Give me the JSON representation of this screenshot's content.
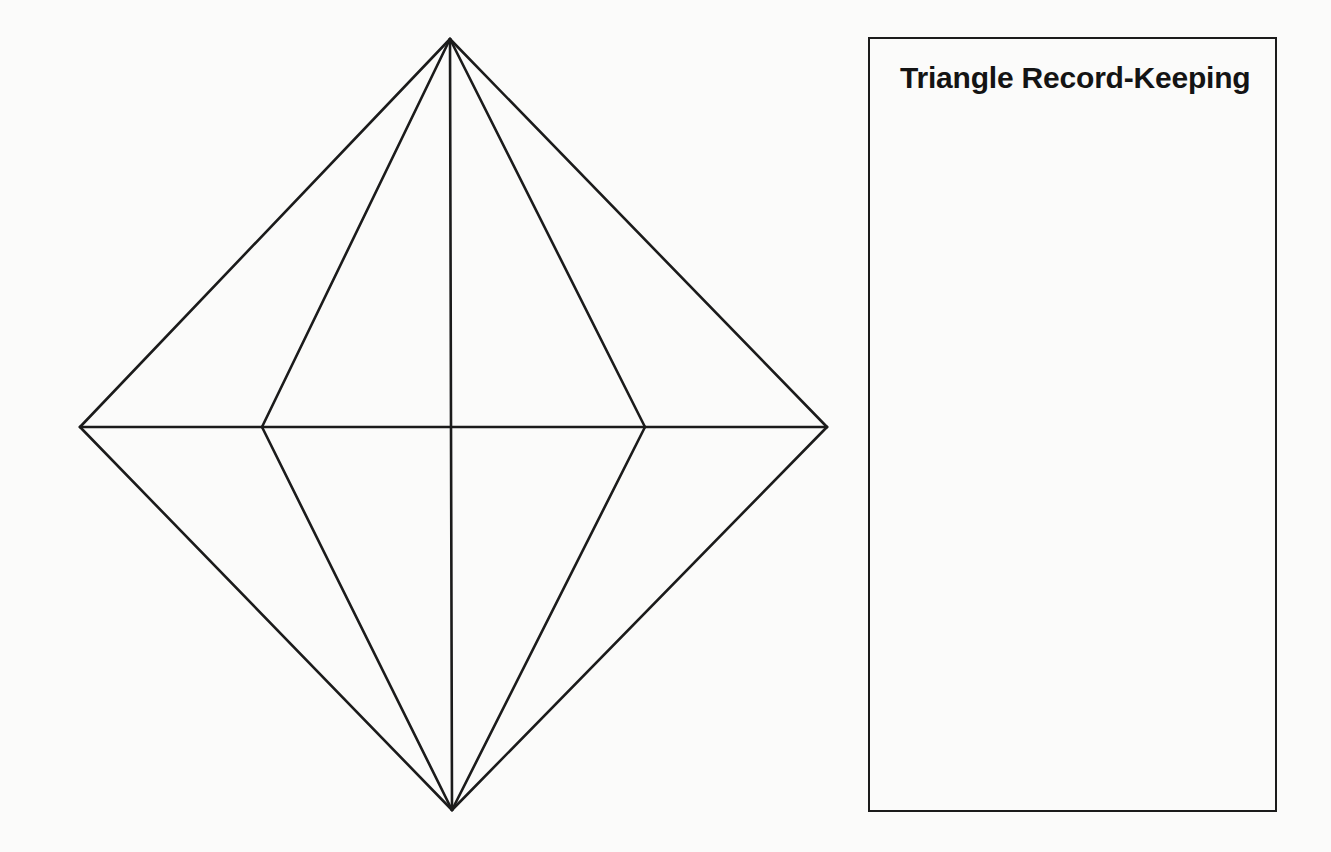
{
  "canvas": {
    "width": 1331,
    "height": 852,
    "background_color": "#fbfbfa",
    "ink_color": "#1b1b1b"
  },
  "figure": {
    "name": "octahedron-wireframe",
    "stroke_color": "#1b1b1b",
    "stroke_width": 2.6,
    "fill": "none",
    "vertices": {
      "top_apex": [
        450,
        39
      ],
      "bottom_apex": [
        452,
        810
      ],
      "left_outer": [
        80,
        427
      ],
      "right_outer": [
        827,
        427
      ],
      "left_inner": [
        262,
        427
      ],
      "right_inner": [
        645,
        427
      ],
      "center": [
        451,
        427
      ]
    },
    "edges": [
      {
        "name": "apex-to-left-outer",
        "from": [
          450,
          39
        ],
        "to": [
          80,
          427
        ]
      },
      {
        "name": "apex-to-right-outer",
        "from": [
          450,
          39
        ],
        "to": [
          827,
          427
        ]
      },
      {
        "name": "apex-to-left-inner",
        "from": [
          450,
          39
        ],
        "to": [
          262,
          427
        ]
      },
      {
        "name": "apex-to-right-inner",
        "from": [
          450,
          39
        ],
        "to": [
          645,
          427
        ]
      },
      {
        "name": "base-to-left-outer",
        "from": [
          452,
          810
        ],
        "to": [
          80,
          427
        ]
      },
      {
        "name": "base-to-right-outer",
        "from": [
          452,
          810
        ],
        "to": [
          827,
          427
        ]
      },
      {
        "name": "base-to-left-inner",
        "from": [
          452,
          810
        ],
        "to": [
          262,
          427
        ]
      },
      {
        "name": "base-to-right-inner",
        "from": [
          452,
          810
        ],
        "to": [
          645,
          427
        ]
      },
      {
        "name": "horizontal-equator",
        "from": [
          80,
          427
        ],
        "to": [
          827,
          427
        ]
      },
      {
        "name": "vertical-axis",
        "from": [
          450,
          39
        ],
        "to": [
          452,
          810
        ]
      }
    ]
  },
  "notes_panel": {
    "title": "Triangle Record-Keeping",
    "border_color": "#1b1b1b",
    "bounds": {
      "x": 868,
      "y": 37,
      "width": 409,
      "height": 775
    },
    "body_lines": []
  }
}
